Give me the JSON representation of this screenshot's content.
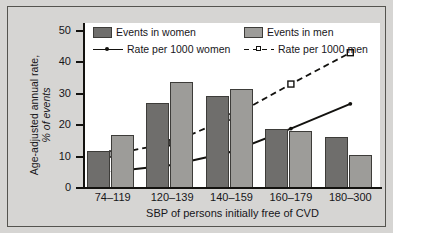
{
  "chart_data": {
    "type": "bar",
    "title": "",
    "xlabel": "SBP of persons initially free of CVD",
    "ylabel_line1": "Age-adjusted annual rate,",
    "ylabel_line2": "% of events",
    "categories": [
      "74–119",
      "120–139",
      "140–159",
      "160–179",
      "180–300"
    ],
    "ylim": [
      0,
      50
    ],
    "yticks": [
      0,
      10,
      20,
      30,
      40,
      50
    ],
    "grid": false,
    "legend_position": "top-inside",
    "series": [
      {
        "name": "Events in women",
        "kind": "bar",
        "color": "#6f6e6c",
        "values": [
          11.2,
          25.8,
          28.0,
          18.0,
          15.5
        ]
      },
      {
        "name": "Events in men",
        "kind": "bar",
        "color": "#9d9c99",
        "values": [
          16.0,
          32.0,
          30.0,
          17.2,
          10.0
        ]
      },
      {
        "name": "Rate per 1000 women",
        "kind": "line",
        "style": "solid",
        "color": "#13120f",
        "marker": "dot",
        "values": [
          5.0,
          7.0,
          11.0,
          18.0,
          25.5
        ]
      },
      {
        "name": "Rate per 1000 men",
        "kind": "line",
        "style": "dashed",
        "color": "#13120f",
        "marker": "square",
        "values": [
          10.3,
          13.7,
          21.5,
          31.5,
          41.0
        ]
      }
    ]
  },
  "legend": {
    "items": [
      {
        "label": "Events in women"
      },
      {
        "label": "Events in men"
      },
      {
        "label": "Rate per 1000 women"
      },
      {
        "label": "Rate per 1000 men"
      }
    ]
  },
  "axis": {
    "y_ticks": [
      "50",
      "40",
      "30",
      "20",
      "10",
      "0"
    ]
  }
}
